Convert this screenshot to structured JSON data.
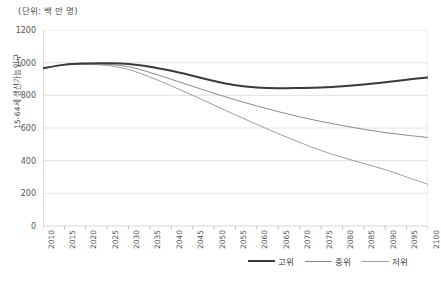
{
  "chart_data": {
    "type": "line",
    "title": "(단위: 백 만 명)",
    "xlabel": "",
    "ylabel": "15-64세 생산가능인구",
    "ylim": [
      0,
      1200
    ],
    "ytick_step": 200,
    "yticks": [
      0,
      200,
      400,
      600,
      800,
      1000,
      1200
    ],
    "grid": true,
    "legend_position": "bottom-right",
    "x": [
      2010,
      2015,
      2020,
      2025,
      2030,
      2035,
      2040,
      2045,
      2050,
      2055,
      2060,
      2065,
      2070,
      2075,
      2080,
      2085,
      2090,
      2095,
      2100
    ],
    "categories": [
      "2010",
      "2015",
      "2020",
      "2025",
      "2030",
      "2035",
      "2040",
      "2045",
      "2050",
      "2055",
      "2060",
      "2065",
      "2070",
      "2075",
      "2080",
      "2085",
      "2090",
      "2095",
      "2100"
    ],
    "series": [
      {
        "name": "고위",
        "color": "#3a3a3a",
        "width": 2.0,
        "values": [
          965,
          988,
          995,
          996,
          992,
          975,
          950,
          920,
          888,
          862,
          848,
          843,
          845,
          848,
          855,
          866,
          880,
          896,
          910
        ]
      },
      {
        "name": "중위",
        "color": "#8a8a8a",
        "width": 1.0,
        "values": [
          965,
          987,
          993,
          990,
          975,
          940,
          898,
          855,
          812,
          772,
          735,
          700,
          668,
          640,
          615,
          592,
          572,
          556,
          542
        ]
      },
      {
        "name": "저위",
        "color": "#9e9e9e",
        "width": 1.0,
        "values": [
          965,
          986,
          990,
          983,
          958,
          912,
          858,
          800,
          740,
          680,
          622,
          565,
          512,
          462,
          420,
          382,
          345,
          300,
          255
        ]
      }
    ]
  },
  "legend": {
    "items": [
      {
        "label": "고위"
      },
      {
        "label": "중위"
      },
      {
        "label": "저위"
      }
    ]
  },
  "axes": {
    "ytick_labels": [
      "1200",
      "1000",
      "800",
      "600",
      "400",
      "200",
      "0"
    ],
    "xtick_labels": [
      "2010",
      "2015",
      "2020",
      "2025",
      "2030",
      "2035",
      "2040",
      "2045",
      "2050",
      "2055",
      "2060",
      "2065",
      "2070",
      "2075",
      "2080",
      "2085",
      "2090",
      "2095",
      "2100"
    ]
  },
  "colors": {
    "grid": "#d9d9d9",
    "axis": "#b0b0b0",
    "text": "#4a4a4a",
    "high": "#3a3a3a",
    "medium": "#8a8a8a",
    "low": "#9e9e9e"
  }
}
